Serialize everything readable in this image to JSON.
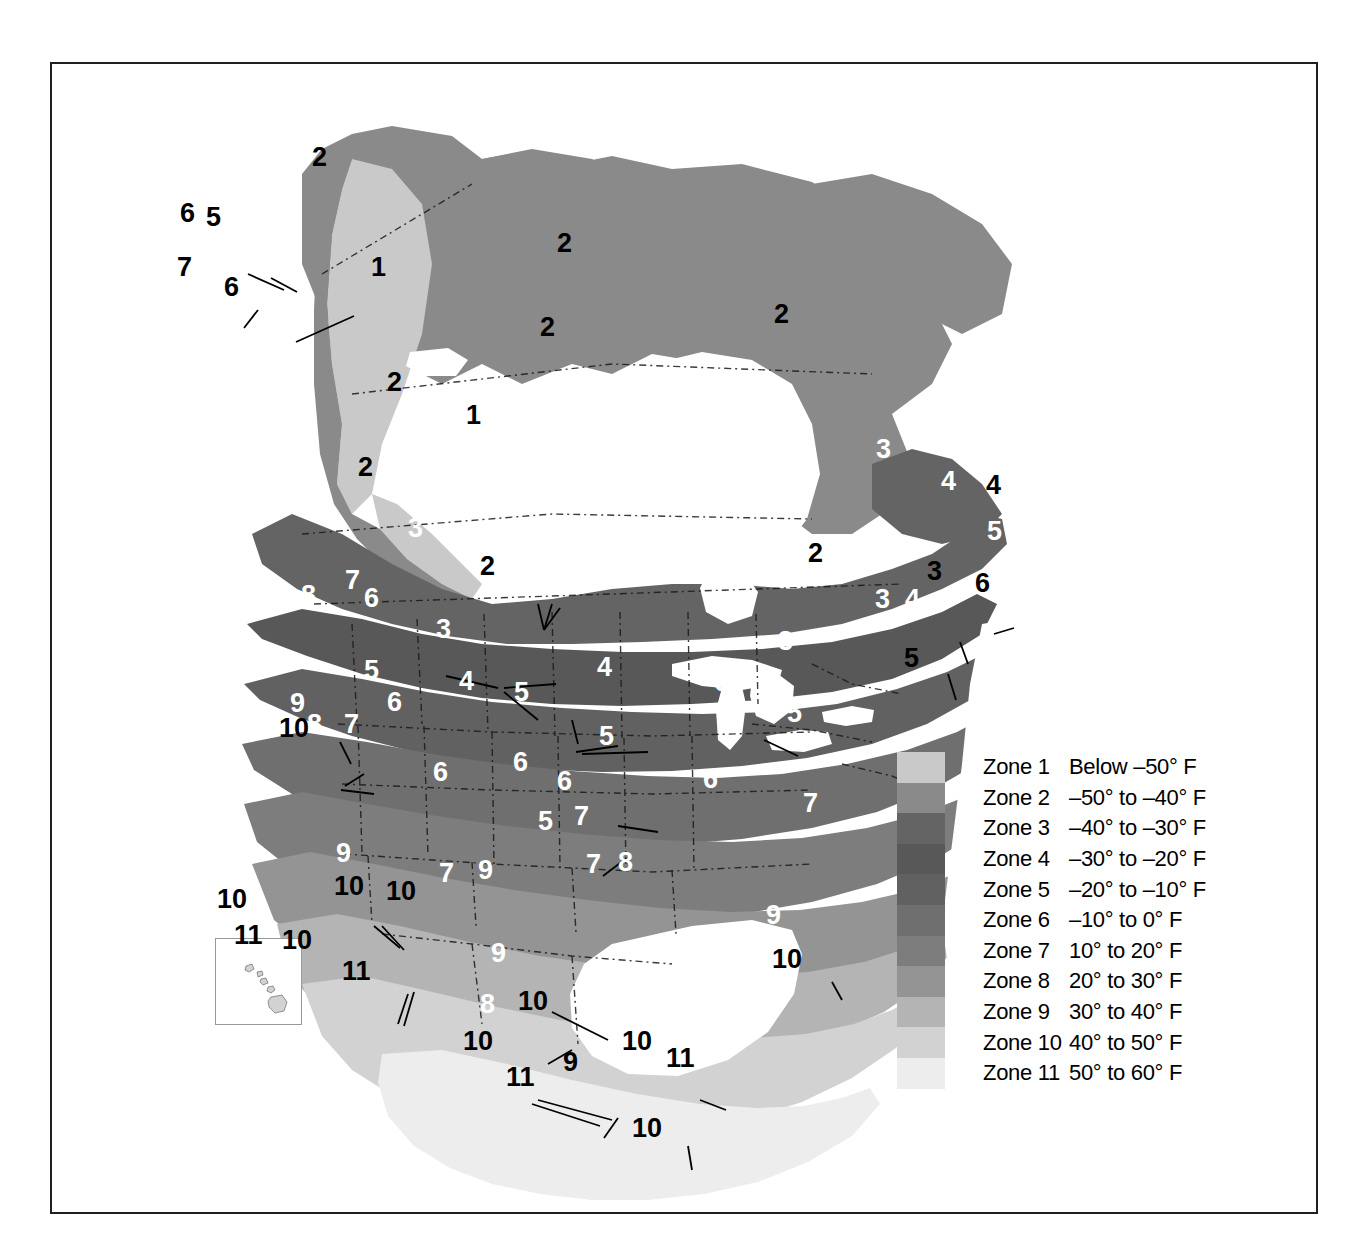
{
  "legend": {
    "rows": [
      {
        "zone": "Zone 1",
        "range": "Below –50° F",
        "color": "#c9c9c9"
      },
      {
        "zone": "Zone 2",
        "range": "–50° to –40° F",
        "color": "#8a8a8a"
      },
      {
        "zone": "Zone 3",
        "range": "–40° to –30° F",
        "color": "#646464"
      },
      {
        "zone": "Zone 4",
        "range": "–30° to –20° F",
        "color": "#585858"
      },
      {
        "zone": "Zone 5",
        "range": "–20° to –10° F",
        "color": "#616161"
      },
      {
        "zone": "Zone 6",
        "range": "–10° to 0° F",
        "color": "#6f6f6f"
      },
      {
        "zone": "Zone 7",
        "range": "10° to 20° F",
        "color": "#7d7d7d"
      },
      {
        "zone": "Zone 8",
        "range": "20° to 30° F",
        "color": "#949494"
      },
      {
        "zone": "Zone 9",
        "range": "30° to 40° F",
        "color": "#b4b4b4"
      },
      {
        "zone": "Zone 10",
        "range": "40° to 50° F",
        "color": "#d2d2d2"
      },
      {
        "zone": "Zone 11",
        "range": "50° to 60° F",
        "color": "#ededed"
      }
    ]
  },
  "map_labels": [
    {
      "text": "2",
      "x": 310,
      "y": 142,
      "size": 27,
      "color": "black"
    },
    {
      "text": "6",
      "x": 178,
      "y": 198,
      "size": 27,
      "color": "black"
    },
    {
      "text": "5",
      "x": 204,
      "y": 202,
      "size": 27,
      "color": "black"
    },
    {
      "text": "4",
      "x": 229,
      "y": 196,
      "size": 27,
      "color": "white"
    },
    {
      "text": "3",
      "x": 254,
      "y": 207,
      "size": 27,
      "color": "white"
    },
    {
      "text": "7",
      "x": 175,
      "y": 252,
      "size": 27,
      "color": "black"
    },
    {
      "text": "6",
      "x": 222,
      "y": 272,
      "size": 27,
      "color": "black"
    },
    {
      "text": "1",
      "x": 369,
      "y": 252,
      "size": 27,
      "color": "black"
    },
    {
      "text": "2",
      "x": 555,
      "y": 228,
      "size": 27,
      "color": "black"
    },
    {
      "text": "2",
      "x": 772,
      "y": 299,
      "size": 27,
      "color": "black"
    },
    {
      "text": "2",
      "x": 538,
      "y": 312,
      "size": 27,
      "color": "black"
    },
    {
      "text": "2",
      "x": 385,
      "y": 367,
      "size": 27,
      "color": "black"
    },
    {
      "text": "1",
      "x": 464,
      "y": 400,
      "size": 27,
      "color": "black"
    },
    {
      "text": "2",
      "x": 356,
      "y": 452,
      "size": 27,
      "color": "black"
    },
    {
      "text": "3",
      "x": 874,
      "y": 434,
      "size": 27,
      "color": "white"
    },
    {
      "text": "4",
      "x": 939,
      "y": 466,
      "size": 27,
      "color": "white"
    },
    {
      "text": "4",
      "x": 984,
      "y": 470,
      "size": 27,
      "color": "black"
    },
    {
      "text": "2",
      "x": 806,
      "y": 538,
      "size": 27,
      "color": "black"
    },
    {
      "text": "5",
      "x": 985,
      "y": 516,
      "size": 27,
      "color": "white"
    },
    {
      "text": "3",
      "x": 504,
      "y": 478,
      "size": 27,
      "color": "white"
    },
    {
      "text": "3",
      "x": 406,
      "y": 513,
      "size": 27,
      "color": "white"
    },
    {
      "text": "3",
      "x": 775,
      "y": 535,
      "size": 27,
      "color": "white"
    },
    {
      "text": "3",
      "x": 925,
      "y": 556,
      "size": 27,
      "color": "black"
    },
    {
      "text": "6",
      "x": 973,
      "y": 568,
      "size": 27,
      "color": "black"
    },
    {
      "text": "3",
      "x": 501,
      "y": 538,
      "size": 27,
      "color": "white"
    },
    {
      "text": "2",
      "x": 478,
      "y": 551,
      "size": 27,
      "color": "black"
    },
    {
      "text": "3",
      "x": 873,
      "y": 584,
      "size": 27,
      "color": "white"
    },
    {
      "text": "4",
      "x": 903,
      "y": 584,
      "size": 27,
      "color": "white"
    },
    {
      "text": "5",
      "x": 902,
      "y": 643,
      "size": 27,
      "color": "black"
    },
    {
      "text": "8",
      "x": 299,
      "y": 580,
      "size": 27,
      "color": "white"
    },
    {
      "text": "7",
      "x": 343,
      "y": 565,
      "size": 27,
      "color": "white"
    },
    {
      "text": "6",
      "x": 362,
      "y": 583,
      "size": 27,
      "color": "white"
    },
    {
      "text": "3",
      "x": 434,
      "y": 614,
      "size": 27,
      "color": "white"
    },
    {
      "text": "5",
      "x": 362,
      "y": 655,
      "size": 27,
      "color": "white"
    },
    {
      "text": "4",
      "x": 457,
      "y": 666,
      "size": 27,
      "color": "white"
    },
    {
      "text": "4",
      "x": 595,
      "y": 652,
      "size": 27,
      "color": "white"
    },
    {
      "text": "6",
      "x": 385,
      "y": 687,
      "size": 27,
      "color": "white"
    },
    {
      "text": "5",
      "x": 512,
      "y": 677,
      "size": 27,
      "color": "white"
    },
    {
      "text": "3",
      "x": 776,
      "y": 626,
      "size": 27,
      "color": "white"
    },
    {
      "text": "6",
      "x": 712,
      "y": 667,
      "size": 27,
      "color": "white"
    },
    {
      "text": "5",
      "x": 785,
      "y": 698,
      "size": 27,
      "color": "white"
    },
    {
      "text": "9",
      "x": 288,
      "y": 688,
      "size": 27,
      "color": "white"
    },
    {
      "text": "8",
      "x": 305,
      "y": 709,
      "size": 27,
      "color": "white"
    },
    {
      "text": "7",
      "x": 342,
      "y": 709,
      "size": 27,
      "color": "white"
    },
    {
      "text": "10",
      "x": 277,
      "y": 713,
      "size": 27,
      "color": "black"
    },
    {
      "text": "5",
      "x": 597,
      "y": 721,
      "size": 27,
      "color": "white"
    },
    {
      "text": "6",
      "x": 511,
      "y": 747,
      "size": 27,
      "color": "white"
    },
    {
      "text": "6",
      "x": 431,
      "y": 757,
      "size": 27,
      "color": "white"
    },
    {
      "text": "6",
      "x": 555,
      "y": 766,
      "size": 27,
      "color": "white"
    },
    {
      "text": "6",
      "x": 701,
      "y": 764,
      "size": 27,
      "color": "white"
    },
    {
      "text": "7",
      "x": 801,
      "y": 788,
      "size": 27,
      "color": "white"
    },
    {
      "text": "5",
      "x": 536,
      "y": 806,
      "size": 27,
      "color": "white"
    },
    {
      "text": "7",
      "x": 572,
      "y": 801,
      "size": 27,
      "color": "white"
    },
    {
      "text": "9",
      "x": 334,
      "y": 838,
      "size": 27,
      "color": "white"
    },
    {
      "text": "7",
      "x": 437,
      "y": 858,
      "size": 27,
      "color": "white"
    },
    {
      "text": "9",
      "x": 476,
      "y": 855,
      "size": 27,
      "color": "white"
    },
    {
      "text": "7",
      "x": 584,
      "y": 849,
      "size": 27,
      "color": "white"
    },
    {
      "text": "8",
      "x": 616,
      "y": 847,
      "size": 27,
      "color": "white"
    },
    {
      "text": "9",
      "x": 764,
      "y": 900,
      "size": 27,
      "color": "white"
    },
    {
      "text": "10",
      "x": 770,
      "y": 944,
      "size": 27,
      "color": "black"
    },
    {
      "text": "10",
      "x": 332,
      "y": 871,
      "size": 27,
      "color": "black"
    },
    {
      "text": "10",
      "x": 384,
      "y": 876,
      "size": 27,
      "color": "black"
    },
    {
      "text": "11",
      "x": 340,
      "y": 956,
      "size": 27,
      "color": "black"
    },
    {
      "text": "9",
      "x": 489,
      "y": 938,
      "size": 27,
      "color": "white"
    },
    {
      "text": "8",
      "x": 478,
      "y": 989,
      "size": 27,
      "color": "white"
    },
    {
      "text": "10",
      "x": 516,
      "y": 986,
      "size": 27,
      "color": "black"
    },
    {
      "text": "10",
      "x": 461,
      "y": 1026,
      "size": 27,
      "color": "black"
    },
    {
      "text": "11",
      "x": 504,
      "y": 1062,
      "size": 27,
      "color": "black"
    },
    {
      "text": "9",
      "x": 561,
      "y": 1047,
      "size": 27,
      "color": "black"
    },
    {
      "text": "10",
      "x": 620,
      "y": 1026,
      "size": 27,
      "color": "black"
    },
    {
      "text": "11",
      "x": 664,
      "y": 1043,
      "size": 27,
      "color": "black"
    },
    {
      "text": "10",
      "x": 630,
      "y": 1113,
      "size": 27,
      "color": "black"
    }
  ],
  "hawaii_inset": {
    "labels": [
      {
        "text": "10",
        "x": 215,
        "y": 884,
        "color": "black"
      },
      {
        "text": "11",
        "x": 232,
        "y": 920,
        "color": "black"
      },
      {
        "text": "10",
        "x": 280,
        "y": 925,
        "color": "black"
      }
    ]
  }
}
